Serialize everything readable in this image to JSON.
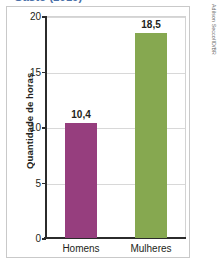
{
  "figure": {
    "title_clipped": "Gasto (2019)",
    "credit": "Adilson Secco/ID/BR"
  },
  "chart_data": {
    "type": "bar",
    "title": "Gasto (2019)",
    "xlabel": "",
    "ylabel": "Quantidade de horas",
    "categories": [
      "Homens",
      "Mulheres"
    ],
    "values": [
      10.4,
      18.5
    ],
    "value_labels": [
      "10,4",
      "18,5"
    ],
    "ylim": [
      0,
      20
    ],
    "yticks": [
      0,
      5,
      10,
      15,
      20
    ],
    "ytick_labels": [
      "0",
      "5",
      "10",
      "15",
      "20"
    ],
    "grid": true,
    "legend": "none",
    "bar_colors": [
      "#963E7E",
      "#86A850"
    ]
  },
  "colors": {
    "purple": "#963E7E",
    "green": "#86A850",
    "axis": "#2b2b2b",
    "grid": "#d8d8d8",
    "frame": "#c9c9c9",
    "title": "#4a6fa8"
  }
}
